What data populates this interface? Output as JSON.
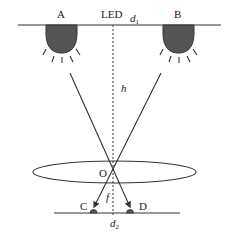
{
  "diagram": {
    "labels": {
      "lamp_a": "A",
      "led": "LED",
      "d1": "d",
      "d1_sub": "1",
      "lamp_b": "B",
      "h": "h",
      "o": "O",
      "f": "f",
      "c": "C",
      "d": "D",
      "d2": "d",
      "d2_sub": "2"
    },
    "colors": {
      "line": "#333333",
      "bulb_fill": "#555555",
      "background": "#ffffff"
    }
  }
}
